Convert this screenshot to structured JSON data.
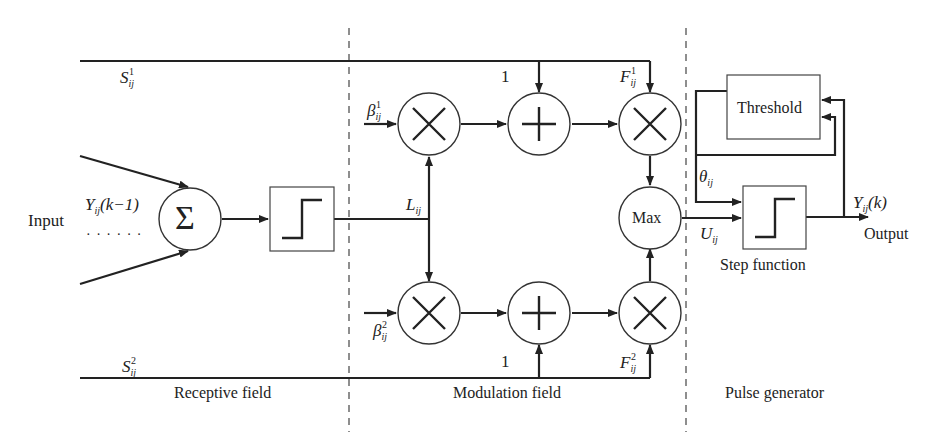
{
  "diagram": {
    "type": "block-diagram",
    "regions": [
      {
        "id": "receptive",
        "label": "Receptive field"
      },
      {
        "id": "modulation",
        "label": "Modulation field"
      },
      {
        "id": "pulse",
        "label": "Pulse generator"
      }
    ],
    "labels": {
      "input": "Input",
      "input_signal": "Y",
      "input_signal_sub": "ij",
      "input_signal_arg": "(k−1)",
      "dots": "· · · · · ·",
      "s1": "S",
      "s1_sub": "ij",
      "s1_sup": "1",
      "s2": "S",
      "s2_sub": "ij",
      "s2_sup": "2",
      "l": "L",
      "l_sub": "ij",
      "beta1": "β",
      "beta1_sub": "ij",
      "beta1_sup": "1",
      "beta2": "β",
      "beta2_sub": "ij",
      "beta2_sup": "2",
      "one_top": "1",
      "one_bottom": "1",
      "f1": "F",
      "f1_sub": "ij",
      "f1_sup": "1",
      "f2": "F",
      "f2_sub": "ij",
      "f2_sup": "2",
      "u": "U",
      "u_sub": "ij",
      "theta": "θ",
      "theta_sub": "ij",
      "output_signal": "Y",
      "output_signal_sub": "ij",
      "output_signal_arg": "(k)",
      "output": "Output",
      "max": "Max",
      "sigma": "Σ",
      "threshold": "Threshold",
      "step_function": "Step function"
    },
    "nodes": [
      {
        "id": "sum",
        "symbol": "Σ"
      },
      {
        "id": "step1",
        "symbol": "step"
      },
      {
        "id": "mul_top_1",
        "symbol": "×"
      },
      {
        "id": "add_top",
        "symbol": "+"
      },
      {
        "id": "mul_top_2",
        "symbol": "×"
      },
      {
        "id": "max",
        "symbol": "Max"
      },
      {
        "id": "mul_bot_1",
        "symbol": "×"
      },
      {
        "id": "add_bot",
        "symbol": "+"
      },
      {
        "id": "mul_bot_2",
        "symbol": "×"
      },
      {
        "id": "threshold",
        "symbol": "Threshold"
      },
      {
        "id": "step2",
        "symbol": "Step function"
      }
    ],
    "edges": [
      [
        "input",
        "sum"
      ],
      [
        "sum",
        "step1"
      ],
      [
        "step1",
        "L"
      ],
      [
        "L",
        "mul_top_1"
      ],
      [
        "L",
        "mul_bot_1"
      ],
      [
        "beta1",
        "mul_top_1"
      ],
      [
        "beta2",
        "mul_bot_1"
      ],
      [
        "mul_top_1",
        "add_top"
      ],
      [
        "mul_bot_1",
        "add_bot"
      ],
      [
        "S1",
        "add_top"
      ],
      [
        "S1",
        "mul_top_2"
      ],
      [
        "S2",
        "add_bot"
      ],
      [
        "S2",
        "mul_bot_2"
      ],
      [
        "add_top",
        "mul_top_2"
      ],
      [
        "add_bot",
        "mul_bot_2"
      ],
      [
        "mul_top_2",
        "max"
      ],
      [
        "mul_bot_2",
        "max"
      ],
      [
        "max",
        "step2"
      ],
      [
        "threshold",
        "step2"
      ],
      [
        "step2",
        "output"
      ],
      [
        "output",
        "threshold"
      ]
    ]
  }
}
